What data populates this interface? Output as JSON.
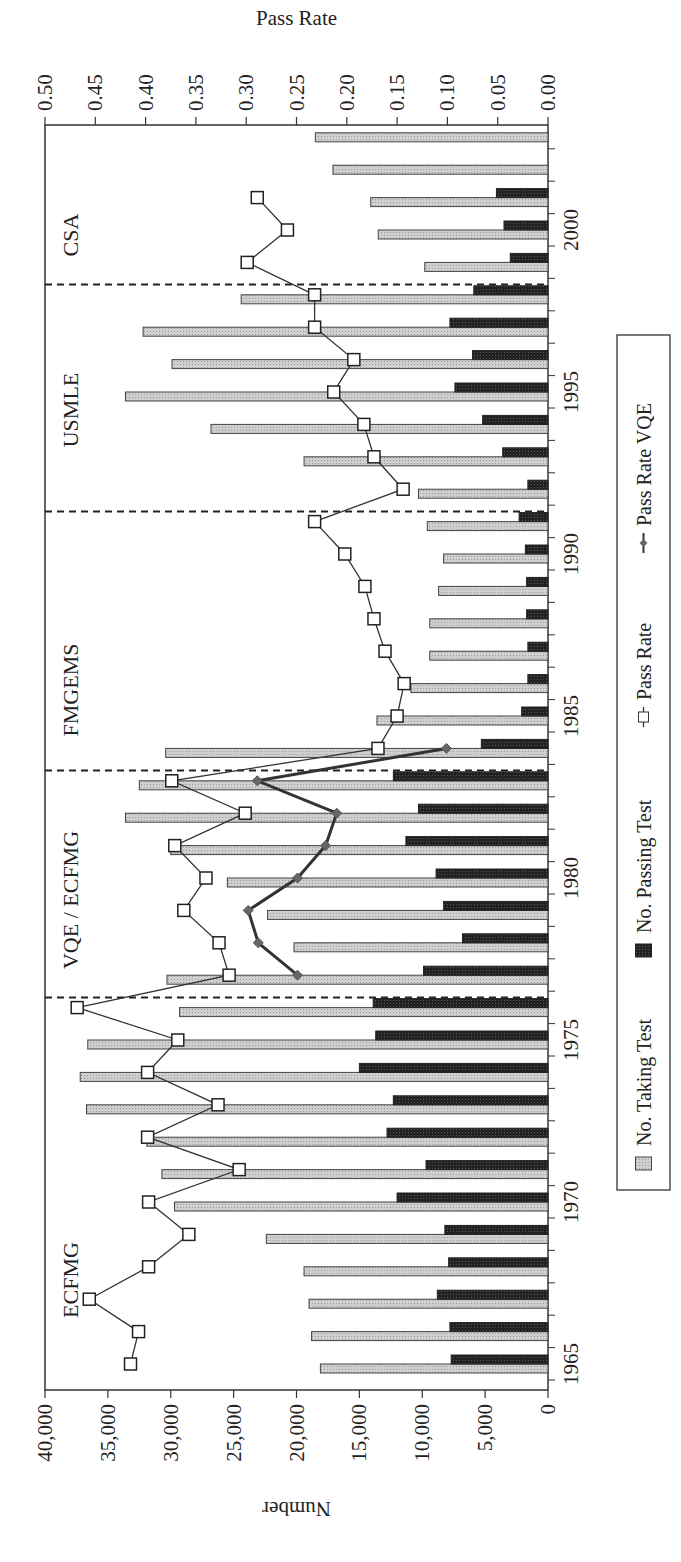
{
  "chart_data": {
    "type": "bar",
    "title": "",
    "xlabel": "",
    "ylabel": "Number",
    "y2label": "Pass Rate",
    "ylim": [
      0,
      40000
    ],
    "y2lim": [
      0,
      0.5
    ],
    "y_ticks": [
      "0",
      "5,000",
      "10,000",
      "15,000",
      "20,000",
      "25,000",
      "30,000",
      "35,000",
      "40,000"
    ],
    "y2_ticks": [
      "0.00",
      "0.05",
      "0.10",
      "0.15",
      "0.20",
      "0.25",
      "0.30",
      "0.35",
      "0.40",
      "0.45",
      "0.50"
    ],
    "x_tick_labels": [
      "1965",
      "1970",
      "1975",
      "1980",
      "1985",
      "1990",
      "1995",
      "2000"
    ],
    "grid": false,
    "legend_position": "bottom",
    "orientation_note": "rotated 90 degrees counter-clockwise on page",
    "categories": [
      "1965",
      "1966",
      "1967",
      "1968",
      "1969",
      "1970",
      "1971",
      "1972",
      "1973",
      "1974",
      "1975",
      "1976",
      "1977",
      "1978",
      "1979",
      "1980",
      "1981",
      "1982",
      "1983",
      "1984",
      "1985",
      "1986",
      "1987",
      "1988",
      "1989",
      "1990",
      "1991",
      "1992",
      "1993",
      "1994",
      "1995",
      "1996",
      "1997",
      "1998",
      "1999",
      "2000",
      "2001",
      "2002",
      "2003"
    ],
    "series": [
      {
        "name": "No. Taking Test",
        "kind": "bar",
        "axis": "left",
        "color": "#c8c8c8",
        "values": [
          18100,
          18800,
          19000,
          19400,
          22400,
          29700,
          30700,
          31900,
          36700,
          37200,
          36600,
          29300,
          30300,
          20200,
          22300,
          25500,
          30000,
          33600,
          32500,
          30400,
          13600,
          10900,
          9400,
          9400,
          8700,
          8300,
          9600,
          10300,
          19400,
          26800,
          33600,
          29900,
          32200,
          24400,
          9800,
          13500,
          14100,
          17100,
          18500
        ]
      },
      {
        "name": "No. Passing Test",
        "kind": "bar",
        "axis": "left",
        "color": "#2a2a2a",
        "values": [
          7700,
          7800,
          8800,
          7900,
          8200,
          12000,
          9700,
          12800,
          12300,
          15000,
          13700,
          13900,
          9900,
          6800,
          8300,
          8900,
          11300,
          10300,
          12300,
          5300,
          2100,
          1600,
          1600,
          1700,
          1700,
          1800,
          2300,
          1600,
          3600,
          5200,
          7400,
          6000,
          7800,
          5900,
          3000,
          3500,
          4100,
          null,
          null
        ]
      },
      {
        "name": "Pass Rate",
        "kind": "line",
        "marker": "square",
        "axis": "right",
        "values": [
          0.415,
          0.407,
          0.456,
          0.397,
          0.357,
          0.397,
          0.307,
          0.398,
          0.328,
          0.398,
          0.368,
          0.468,
          0.317,
          0.327,
          0.362,
          0.34,
          0.371,
          0.301,
          0.374,
          0.169,
          0.15,
          0.143,
          0.162,
          0.173,
          0.182,
          0.202,
          0.232,
          0.144,
          0.173,
          0.183,
          0.213,
          0.193,
          0.232,
          0.232,
          0.299,
          0.259,
          0.289,
          null,
          null
        ]
      },
      {
        "name": "Pass Rate VQE",
        "kind": "line",
        "marker": "diamond",
        "axis": "right",
        "color": "#555555",
        "values": [
          null,
          null,
          null,
          null,
          null,
          null,
          null,
          null,
          null,
          null,
          null,
          null,
          0.249,
          0.288,
          0.298,
          0.249,
          0.221,
          0.21,
          0.289,
          0.101,
          null,
          null,
          null,
          null,
          null,
          null,
          null,
          null,
          null,
          null,
          null,
          null,
          null,
          null,
          null,
          null,
          null,
          null,
          null
        ]
      }
    ],
    "regions": [
      {
        "label": "ECFMG",
        "from": "1965",
        "to": "1976"
      },
      {
        "label": "VQE / ECFMG",
        "from": "1977",
        "to": "1983"
      },
      {
        "label": "FMGEMS",
        "from": "1984",
        "to": "1991"
      },
      {
        "label": "USMLE",
        "from": "1992",
        "to": "1998"
      },
      {
        "label": "CSA",
        "from": "1999",
        "to": "2003"
      }
    ],
    "region_boundaries_after": [
      "1976",
      "1983",
      "1991",
      "1998"
    ],
    "legend": [
      {
        "label": "No. Taking Test",
        "symbol": "gray-box"
      },
      {
        "label": "No. Passing Test",
        "symbol": "black-box"
      },
      {
        "label": "Pass Rate",
        "symbol": "line-square"
      },
      {
        "label": "Pass Rate VQE",
        "symbol": "line-diamond"
      }
    ]
  }
}
